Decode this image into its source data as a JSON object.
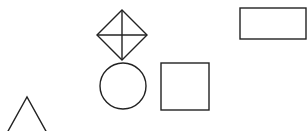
{
  "canvas": {
    "width": 307,
    "height": 131,
    "background": "#ffffff"
  },
  "stroke": {
    "color": "#222222",
    "width": 1.4
  },
  "shapes": [
    {
      "type": "diamond-with-cross",
      "name": "diamond",
      "cx": 122,
      "cy": 35,
      "rx": 25,
      "ry": 25
    },
    {
      "type": "circle",
      "name": "circle",
      "cx": 123,
      "cy": 86,
      "r": 23
    },
    {
      "type": "square",
      "name": "square",
      "x": 161,
      "y": 63,
      "w": 48,
      "h": 47
    },
    {
      "type": "rectangle",
      "name": "rectangle",
      "x": 240,
      "y": 8,
      "w": 66,
      "h": 31
    },
    {
      "type": "triangle",
      "name": "triangle",
      "apex": [
        27,
        97
      ],
      "left": [
        7,
        133
      ],
      "right": [
        47,
        133
      ]
    }
  ]
}
